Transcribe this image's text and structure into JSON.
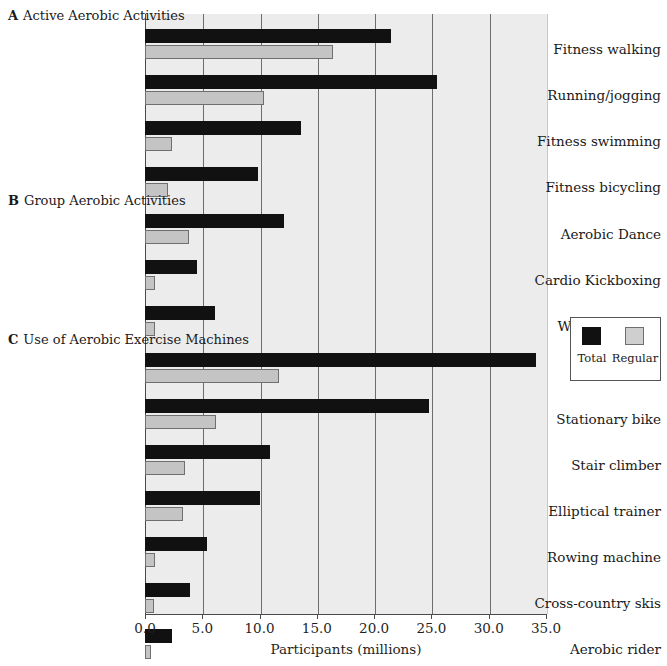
{
  "chart_data": {
    "type": "bar",
    "orientation": "horizontal",
    "title": "",
    "xlabel": "Participants (millions)",
    "ylabel": "",
    "xlim": [
      0.0,
      35.0
    ],
    "xticks": [
      "0.0",
      "5.0",
      "10.0",
      "15.0",
      "20.0",
      "25.0",
      "30.0",
      "35.0"
    ],
    "xtick_values": [
      0.0,
      5.0,
      10.0,
      15.0,
      20.0,
      25.0,
      30.0,
      35.0
    ],
    "grid": "vertical",
    "legend": {
      "position": "right-outside",
      "entries": [
        {
          "name": "Total",
          "color": "#111111"
        },
        {
          "name": "Regular",
          "color": "#cfcfcf"
        }
      ]
    },
    "series": [
      {
        "name": "Total",
        "color": "#111111"
      },
      {
        "name": "Regular",
        "color": "#cfcfcf"
      }
    ],
    "panels": [
      {
        "letter": "A",
        "title": "Active Aerobic Activities",
        "categories": [
          "Fitness walking",
          "Running/jogging",
          "Fitness swimming",
          "Fitness bicycling"
        ],
        "values": {
          "Total": [
            21.5,
            25.5,
            13.6,
            9.9
          ],
          "Regular": [
            16.4,
            10.4,
            2.4,
            2.0
          ]
        }
      },
      {
        "letter": "B",
        "title": "Group Aerobic Activities",
        "categories": [
          "Aerobic Dance",
          "Cardio Kickboxing",
          "Water Exercise"
        ],
        "values": {
          "Total": [
            12.1,
            4.5,
            6.1
          ],
          "Regular": [
            3.8,
            0.9,
            0.9
          ]
        }
      },
      {
        "letter": "C",
        "title": "Use of Aerobic Exercise Machines",
        "categories": [
          "Treadmill",
          "Stationary bike",
          "Stair climber",
          "Elliptical trainer",
          "Rowing machine",
          "Cross-country skis",
          "Aerobic rider"
        ],
        "values": {
          "Total": [
            34.1,
            24.8,
            10.9,
            10.0,
            5.4,
            3.9,
            2.4
          ],
          "Regular": [
            11.7,
            6.2,
            3.5,
            3.3,
            0.9,
            0.8,
            0.5
          ]
        }
      }
    ]
  },
  "layout": {
    "plot_left": 145,
    "plot_right": 546,
    "plot_top": 14,
    "plot_bottom": 614,
    "bar_height": 14,
    "group_pitch": 46,
    "section_a_header_y": 8,
    "section_a_first_bar_y": 29,
    "section_b_header_y": 193,
    "section_b_first_bar_y": 214,
    "section_c_header_y": 332,
    "section_c_first_bar_y": 353
  },
  "colors": {
    "total": "#111111",
    "regular": "#cfcfcf",
    "plot_background": "#ececec",
    "gridline": "#6d6d6d",
    "axis": "#4a4a4a",
    "text": "#1a1a1a"
  }
}
